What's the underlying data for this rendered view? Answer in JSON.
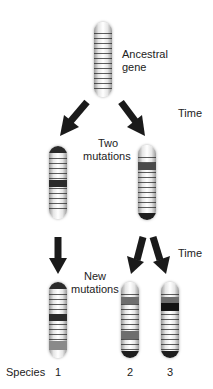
{
  "labels": {
    "ancestral_line1": "Ancestral",
    "ancestral_line2": "gene",
    "time_top": "Time",
    "two": "Two",
    "mutations_mid": "mutations",
    "time_bottom": "Time",
    "new": "New",
    "mutations_bottom": "mutations",
    "species": "Species",
    "species_1": "1",
    "species_2": "2",
    "species_3": "3"
  },
  "colors": {
    "dark_band": "#2a2a2a",
    "gray_band": "#6e6e6e",
    "arrow": "#1a1a1a"
  },
  "chromosomes": [
    {
      "name": "ancestral-gene",
      "mutations": []
    },
    {
      "name": "lineage-a",
      "mutations": [
        "dark top cap",
        "dark middle band"
      ]
    },
    {
      "name": "lineage-b",
      "mutations": [
        "dark upper band",
        "dark bottom cap"
      ]
    },
    {
      "name": "species-1",
      "mutations": [
        "dark top cap",
        "dark middle band",
        "gray lower band"
      ]
    },
    {
      "name": "species-2",
      "mutations": [
        "gray upper band",
        "gray lower band",
        "dark bottom cap"
      ]
    },
    {
      "name": "species-3",
      "mutations": [
        "gray upper band",
        "black upper band",
        "dark bottom cap"
      ]
    }
  ]
}
